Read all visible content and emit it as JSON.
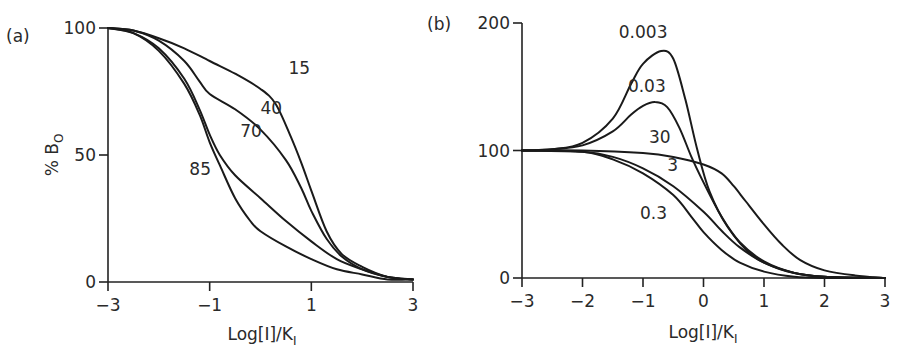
{
  "chart_data": [
    {
      "type": "line",
      "panel_label": "(a)",
      "title": "",
      "xlabel": "Log[I]/K_I",
      "ylabel": "% B_O",
      "xlim": [
        -3,
        3
      ],
      "ylim": [
        0,
        100
      ],
      "xticks": [
        -3,
        -1,
        1,
        3
      ],
      "xtick_labels": [
        "−3",
        "−1",
        "1",
        "3"
      ],
      "yticks": [
        0,
        50,
        100
      ],
      "ytick_labels": [
        "0",
        "50",
        "100"
      ],
      "grid": false,
      "legend": "inline curve labels",
      "series": [
        {
          "name": "15",
          "label_pos": [
            0.55,
            82
          ],
          "x": [
            -3,
            -2.5,
            -2,
            -1.5,
            -1,
            -0.5,
            0,
            0.3,
            0.6,
            0.8,
            1,
            1.3,
            1.6,
            2,
            2.5,
            3
          ],
          "values": [
            100,
            99,
            96,
            92,
            87,
            82,
            76,
            70,
            57,
            47,
            36,
            20,
            11,
            6,
            2,
            1
          ]
        },
        {
          "name": "40",
          "label_pos": [
            0.0,
            66
          ],
          "x": [
            -3,
            -2.5,
            -2,
            -1.5,
            -1.2,
            -1,
            -0.5,
            0,
            0.5,
            0.8,
            1,
            1.3,
            1.6,
            2,
            2.5,
            3
          ],
          "values": [
            100,
            99,
            95,
            87,
            79,
            74,
            68,
            60,
            48,
            37,
            28,
            17,
            10,
            5,
            2,
            1
          ]
        },
        {
          "name": "70",
          "label_pos": [
            -0.4,
            57
          ],
          "x": [
            -3,
            -2.5,
            -2,
            -1.5,
            -1.2,
            -1,
            -0.8,
            -0.5,
            0,
            0.5,
            1,
            1.5,
            2,
            2.5,
            3
          ],
          "values": [
            100,
            98,
            92,
            80,
            68,
            58,
            50,
            42,
            33,
            24,
            16,
            9,
            5,
            2,
            1
          ]
        },
        {
          "name": "85",
          "label_pos": [
            -1.4,
            42
          ],
          "x": [
            -3,
            -2.5,
            -2,
            -1.5,
            -1.2,
            -1,
            -0.8,
            -0.5,
            -0.2,
            0,
            0.5,
            1,
            1.5,
            2,
            2.5,
            3
          ],
          "values": [
            100,
            98,
            91,
            78,
            66,
            55,
            46,
            33,
            24,
            20,
            14,
            9,
            5,
            3,
            1,
            1
          ]
        }
      ]
    },
    {
      "type": "line",
      "panel_label": "(b)",
      "title": "",
      "xlabel": "Log[I]/K_I",
      "ylabel": "",
      "xlim": [
        -3,
        3
      ],
      "ylim": [
        0,
        200
      ],
      "xticks": [
        -3,
        -2,
        -1,
        0,
        1,
        2,
        3
      ],
      "xtick_labels": [
        "−3",
        "−2",
        "−1",
        "0",
        "1",
        "2",
        "3"
      ],
      "yticks": [
        0,
        100,
        200
      ],
      "ytick_labels": [
        "0",
        "100",
        "200"
      ],
      "grid": false,
      "legend": "inline curve labels",
      "series": [
        {
          "name": "0.003",
          "label_pos": [
            -1.4,
            188
          ],
          "x": [
            -3,
            -2.5,
            -2,
            -1.5,
            -1.2,
            -1,
            -0.7,
            -0.5,
            -0.3,
            -0.1,
            0.1,
            0.4,
            0.8,
            1.2,
            1.6,
            2,
            3
          ],
          "values": [
            100,
            101,
            106,
            125,
            152,
            168,
            178,
            172,
            140,
            100,
            68,
            40,
            18,
            8,
            3,
            1,
            0
          ]
        },
        {
          "name": "0.03",
          "label_pos": [
            -1.25,
            146
          ],
          "x": [
            -3,
            -2.5,
            -2,
            -1.5,
            -1.2,
            -1,
            -0.8,
            -0.6,
            -0.4,
            -0.2,
            0,
            0.3,
            0.6,
            1,
            1.5,
            2,
            3
          ],
          "values": [
            100,
            101,
            104,
            115,
            128,
            135,
            138,
            134,
            118,
            95,
            75,
            48,
            28,
            13,
            4,
            1,
            0
          ]
        },
        {
          "name": "30",
          "label_pos": [
            -0.9,
            106
          ],
          "x": [
            -3,
            -2,
            -1,
            -0.5,
            0,
            0.3,
            0.5,
            0.7,
            1,
            1.3,
            1.6,
            2,
            2.5,
            3
          ],
          "values": [
            100,
            100,
            98,
            95,
            89,
            82,
            72,
            60,
            42,
            26,
            14,
            6,
            2,
            0
          ]
        },
        {
          "name": "3",
          "label_pos": [
            -0.6,
            84
          ],
          "x": [
            -3,
            -2,
            -1.5,
            -1,
            -0.5,
            0,
            0.3,
            0.6,
            1,
            1.5,
            2,
            3
          ],
          "values": [
            100,
            99,
            95,
            86,
            72,
            52,
            37,
            24,
            12,
            4,
            1,
            0
          ]
        },
        {
          "name": "0.3",
          "label_pos": [
            -1.05,
            46
          ],
          "x": [
            -3,
            -2,
            -1.5,
            -1,
            -0.5,
            -0.2,
            0,
            0.3,
            0.6,
            1,
            1.5,
            2,
            3
          ],
          "values": [
            100,
            99,
            93,
            82,
            65,
            48,
            36,
            22,
            12,
            5,
            1,
            0,
            0
          ]
        }
      ]
    }
  ],
  "layout": {
    "panels": [
      {
        "x0": 108,
        "x1": 413,
        "y0": 282,
        "y1": 28,
        "ylabel_x": 58,
        "ylabel_y": 155,
        "panel_label_x": 6,
        "panel_label_y": 42,
        "xlabel_x": 262,
        "xlabel_y": 340
      },
      {
        "x0": 522,
        "x1": 885,
        "y0": 278,
        "y1": 23,
        "ylabel_x": 0,
        "ylabel_y": 0,
        "panel_label_x": 427,
        "panel_label_y": 30,
        "xlabel_x": 703,
        "xlabel_y": 338
      }
    ],
    "line_color": "#1a1a1a"
  }
}
